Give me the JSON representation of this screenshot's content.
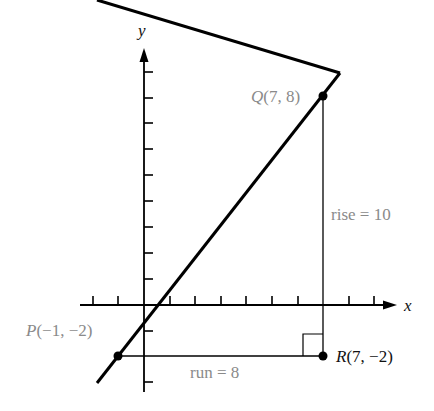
{
  "diagram": {
    "axes": {
      "x_label": "x",
      "y_label": "y",
      "x_ticks": [
        -3,
        -2,
        -1,
        1,
        2,
        3,
        4,
        5,
        6,
        7,
        8,
        9
      ],
      "y_ticks": [
        -3,
        -2,
        -1,
        1,
        2,
        3,
        4,
        5,
        6,
        7,
        8,
        9
      ]
    },
    "points": {
      "P": {
        "label": "P(−1, −2)",
        "x": -1,
        "y": -2
      },
      "Q": {
        "label": "Q(7, 8)",
        "x": 7,
        "y": 8
      },
      "R": {
        "label": "R(7, −2)",
        "x": 7,
        "y": -2
      }
    },
    "annotations": {
      "rise": "rise = 10",
      "run": "run = 8"
    },
    "colors": {
      "line": "#000000",
      "gray_text": "#8a8a8a",
      "dark_text": "#111111"
    }
  }
}
